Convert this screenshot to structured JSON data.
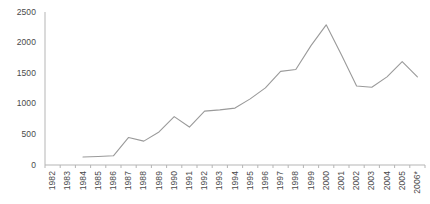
{
  "chart_data": {
    "type": "line",
    "title": "",
    "subtitle": "",
    "xlabel": "",
    "ylabel": "",
    "grid": false,
    "legend": "none",
    "ylim": [
      0,
      2500
    ],
    "yticks": [
      0,
      500,
      1000,
      1500,
      2000,
      2500
    ],
    "ytick_labels": [
      "0",
      "500",
      "1000",
      "1500",
      "2000",
      "2500"
    ],
    "categories": [
      "1982",
      "1983",
      "1984",
      "1985",
      "1986",
      "1987",
      "1988",
      "1989",
      "1990",
      "1991",
      "1992",
      "1993",
      "1994",
      "1995",
      "1996",
      "1997",
      "1998",
      "1999",
      "2000",
      "2001",
      "2002",
      "2003",
      "2004",
      "2005",
      "2006*"
    ],
    "series": [
      {
        "name": "series-1",
        "color": "#9a9a9a",
        "values": [
          null,
          null,
          130,
          140,
          150,
          450,
          390,
          540,
          790,
          620,
          880,
          900,
          930,
          1080,
          1260,
          1530,
          1560,
          1950,
          2290,
          1800,
          1290,
          1270,
          1440,
          1690,
          1440
        ]
      }
    ],
    "annotations": [],
    "axis_color": "#b5b5b5",
    "line_color": "#9a9a9a",
    "text_color": "#4a4a4a"
  }
}
